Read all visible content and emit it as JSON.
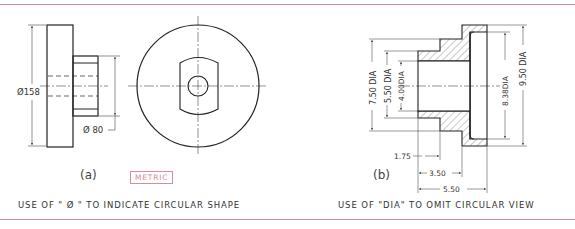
{
  "figure": {
    "border_color": "#d98c9c",
    "panel_a": {
      "tag": "(a)",
      "unit_badge": "METRIC",
      "caption": "USE OF \" Ø \" TO INDICATE CIRCULAR SHAPE",
      "dimensions": {
        "outer_diameter": "Ø158",
        "hub_diameter": "Ø 80"
      }
    },
    "panel_b": {
      "tag": "(b)",
      "caption": "USE OF \"DIA\" TO OMIT CIRCULAR VIEW",
      "dimensions": {
        "dia_750": "7.50 DIA",
        "dia_550": "5.50 DIA",
        "dia_400": "4.00DIA",
        "dia_838": "8.38DIA",
        "dia_950": "9.50 DIA",
        "len_175": "1.75",
        "len_350": "3.50",
        "len_550": "5.50"
      }
    }
  }
}
